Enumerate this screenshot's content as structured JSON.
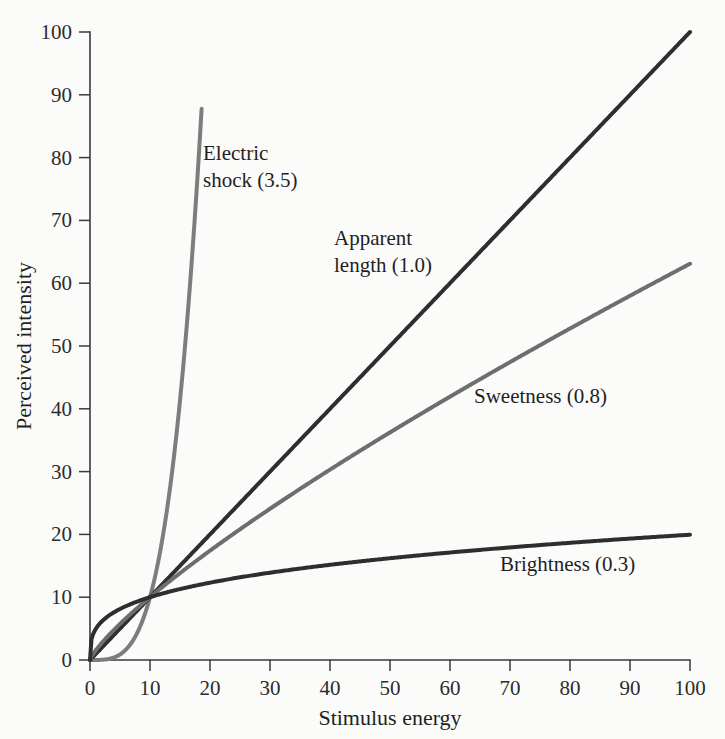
{
  "chart_data": {
    "type": "line",
    "title": "",
    "xlabel": "Stimulus energy",
    "ylabel": "Perceived intensity",
    "xlim": [
      0,
      100
    ],
    "ylim": [
      0,
      100
    ],
    "xticks": [
      "0",
      "10",
      "20",
      "30",
      "40",
      "50",
      "60",
      "70",
      "80",
      "90",
      "100"
    ],
    "yticks": [
      "0",
      "10",
      "20",
      "30",
      "40",
      "50",
      "60",
      "70",
      "80",
      "90",
      "100"
    ],
    "grid": false,
    "legend_position": "inline-annotations",
    "series": [
      {
        "name": "Electric shock",
        "exponent": 3.5,
        "label": "Electric shock (3.5)",
        "color": "#7d7d7d",
        "stroke_width": 4.0,
        "x_end": 18.6,
        "y_end": 95,
        "label_x": 203,
        "label_y": 160,
        "label_lines": [
          "Electric",
          "shock (3.5)"
        ]
      },
      {
        "name": "Apparent length",
        "exponent": 1.0,
        "label": "Apparent length (1.0)",
        "color": "#2e2e2e",
        "stroke_width": 4.0,
        "x_end": 100,
        "y_end": 100,
        "label_x": 334,
        "label_y": 245,
        "label_lines": [
          "Apparent",
          "length (1.0)"
        ]
      },
      {
        "name": "Sweetness",
        "exponent": 0.8,
        "label": "Sweetness (0.8)",
        "color": "#6e6e6e",
        "stroke_width": 4.0,
        "x_end": 100,
        "y_end": 63,
        "label_x": 474,
        "label_y": 403,
        "label_lines": [
          "Sweetness (0.8)"
        ]
      },
      {
        "name": "Brightness",
        "exponent": 0.3,
        "label": "Brightness (0.3)",
        "color": "#2e2e2e",
        "stroke_width": 4.0,
        "x_end": 100,
        "y_end": 20,
        "label_x": 500,
        "label_y": 571,
        "label_lines": [
          "Brightness (0.3)"
        ]
      }
    ]
  },
  "colors": {
    "background": "#fbfbfa",
    "axis": "#3a3a3a",
    "text": "#1f1f1f",
    "dark_curve": "#2e2e2e",
    "gray_curve": "#7d7d7d"
  }
}
